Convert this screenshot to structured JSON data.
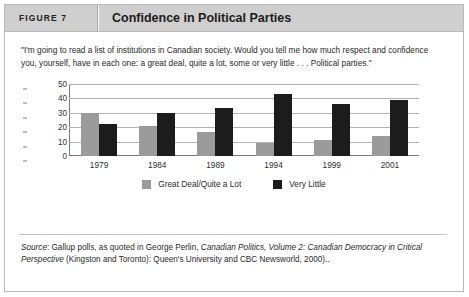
{
  "figure": {
    "number_label": "FIGURE 7",
    "title": "Confidence in Political Parties",
    "quote": "\"I'm going to read a list of institutions in Canadian society. Would you tell me how much respect and confidence you, yourself, have in each one: a great deal, quite a lot, some or very little . . . Political parties.\"",
    "source_prefix": "Source",
    "source_rest": ": Gallup polls, as quoted in George Perlin, ",
    "source_italic_1": "Canadian Politics, Volume 2: Canadian Democracy in Critical Perspective",
    "source_tail": " (Kingston and Toronto): Queen's University and CBC Newsworld, 2000).."
  },
  "chart_data": {
    "type": "bar",
    "title": "Confidence in Political Parties",
    "xlabel": "",
    "ylabel": "",
    "categories": [
      "1979",
      "1984",
      "1989",
      "1994",
      "1999",
      "2001"
    ],
    "series": [
      {
        "name": "Great Deal/Quite a Lot",
        "color": "#9b9b9b",
        "values": [
          30,
          21,
          17,
          9,
          11,
          14
        ]
      },
      {
        "name": "Very Little",
        "color": "#1c1c1c",
        "values": [
          22,
          30,
          33,
          43,
          36,
          39
        ]
      }
    ],
    "ylim": [
      0,
      50
    ],
    "yticks": [
      0,
      10,
      20,
      30,
      40,
      50
    ],
    "grid": true,
    "legend_position": "bottom"
  },
  "colors": {
    "header_bg": "#cfcfcf",
    "frame_border": "#b9b9b9",
    "series_a": "#9b9b9b",
    "series_b": "#1c1c1c"
  }
}
